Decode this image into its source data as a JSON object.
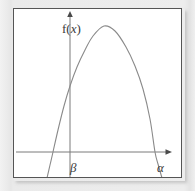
{
  "figure": {
    "type": "math-diagram",
    "background_color": "#e9e9e9",
    "plot_background_color": "#ffffff",
    "frame_color": "#555555",
    "curve_color": "#8a8a8a",
    "axis_color": "#7a7a7a",
    "label_color": "#3a3a3a"
  },
  "labels": {
    "y_axis": "f(x)",
    "y_axis_function_name": "f",
    "y_axis_open_paren": "(",
    "y_axis_variable": "x",
    "y_axis_close_paren": ")",
    "x_axis": "x",
    "left_root": "β",
    "right_root": "α"
  },
  "chart_data": {
    "type": "line",
    "title": "",
    "xlabel": "x",
    "ylabel": "f(x)",
    "grid": false,
    "legend": null,
    "axes": {
      "x_axis_y_pixel": 152,
      "y_axis_x_pixel": 70,
      "x_axis_arrow_x_pixel": 172,
      "y_axis_arrow_y_pixel": 11
    },
    "annotations": [
      {
        "text": "β",
        "role": "left-root",
        "x_pixel": 53,
        "y_pixel": 152
      },
      {
        "text": "α",
        "role": "right-root",
        "x_pixel": 155,
        "y_pixel": 152
      },
      {
        "text": "f(x)",
        "role": "y-axis-label",
        "x_pixel": 58,
        "y_pixel": 18
      },
      {
        "text": "x",
        "role": "x-axis-label",
        "x_pixel": 176,
        "y_pixel": 158
      }
    ],
    "curve": {
      "shape": "parabola",
      "opens": "down",
      "vertex": {
        "x_pixel": 104,
        "y_pixel": 26
      },
      "roots": {
        "beta": 53,
        "alpha": 155
      },
      "y_intercept_pixel": 75,
      "points": [
        [
          47,
          178
        ],
        [
          50,
          165
        ],
        [
          53,
          152
        ],
        [
          58,
          130
        ],
        [
          64,
          106
        ],
        [
          70,
          86
        ],
        [
          77,
          67
        ],
        [
          85,
          50
        ],
        [
          93,
          36
        ],
        [
          104,
          26
        ],
        [
          115,
          31
        ],
        [
          126,
          47
        ],
        [
          135,
          66
        ],
        [
          143,
          89
        ],
        [
          150,
          119
        ],
        [
          155,
          152
        ],
        [
          158,
          164
        ],
        [
          162,
          178
        ]
      ]
    }
  }
}
